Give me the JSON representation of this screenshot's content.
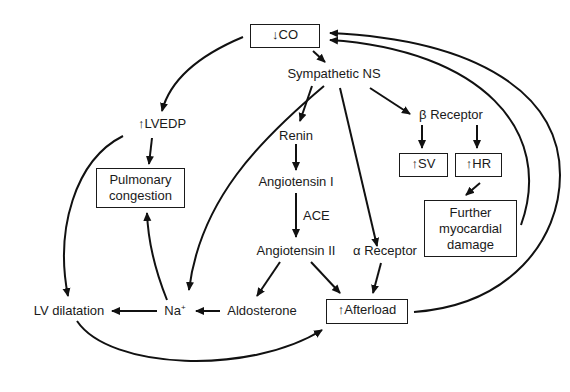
{
  "diagram": {
    "nodes": {
      "co": {
        "arrow": "↓",
        "label": "CO"
      },
      "sympathetic": {
        "label": "Sympathetic NS"
      },
      "lvedp": {
        "arrow": "↑",
        "label": "LVEDP"
      },
      "beta": {
        "symbol": "β",
        "label": "Receptor"
      },
      "sv": {
        "arrow": "↑",
        "label": "SV"
      },
      "hr": {
        "arrow": "↑",
        "label": "HR"
      },
      "renin": {
        "label": "Renin"
      },
      "ang1": {
        "label": "Angiotensin I"
      },
      "ace": {
        "label": "ACE"
      },
      "ang2": {
        "label": "Angiotensin II"
      },
      "alpha": {
        "symbol": "α",
        "label": "Receptor"
      },
      "pulmonary": {
        "line1": "Pulmonary",
        "line2": "congestion"
      },
      "damage": {
        "line1": "Further",
        "line2": "myocardial",
        "line3": "damage"
      },
      "lv_dilatation": {
        "label": "LV dilatation"
      },
      "na": {
        "label": "Na",
        "sup": "+"
      },
      "aldosterone": {
        "label": "Aldosterone"
      },
      "afterload": {
        "arrow": "↑",
        "label": "Afterload"
      }
    },
    "edges": [
      {
        "from": "co",
        "to": "sympathetic"
      },
      {
        "from": "co",
        "to": "lvedp"
      },
      {
        "from": "sympathetic",
        "to": "renin"
      },
      {
        "from": "sympathetic",
        "to": "beta"
      },
      {
        "from": "sympathetic",
        "to": "alpha"
      },
      {
        "from": "sympathetic",
        "to": "na"
      },
      {
        "from": "beta",
        "to": "sv"
      },
      {
        "from": "beta",
        "to": "hr"
      },
      {
        "from": "hr",
        "to": "damage"
      },
      {
        "from": "damage",
        "to": "co"
      },
      {
        "from": "renin",
        "to": "ang1"
      },
      {
        "from": "ang1",
        "to": "ang2",
        "label": "ACE"
      },
      {
        "from": "ang2",
        "to": "aldosterone"
      },
      {
        "from": "ang2",
        "to": "afterload"
      },
      {
        "from": "alpha",
        "to": "afterload"
      },
      {
        "from": "aldosterone",
        "to": "na"
      },
      {
        "from": "na",
        "to": "lv_dilatation"
      },
      {
        "from": "na",
        "to": "pulmonary"
      },
      {
        "from": "lvedp",
        "to": "pulmonary"
      },
      {
        "from": "lvedp",
        "to": "lv_dilatation"
      },
      {
        "from": "lv_dilatation",
        "to": "afterload"
      },
      {
        "from": "afterload",
        "to": "co"
      }
    ]
  }
}
